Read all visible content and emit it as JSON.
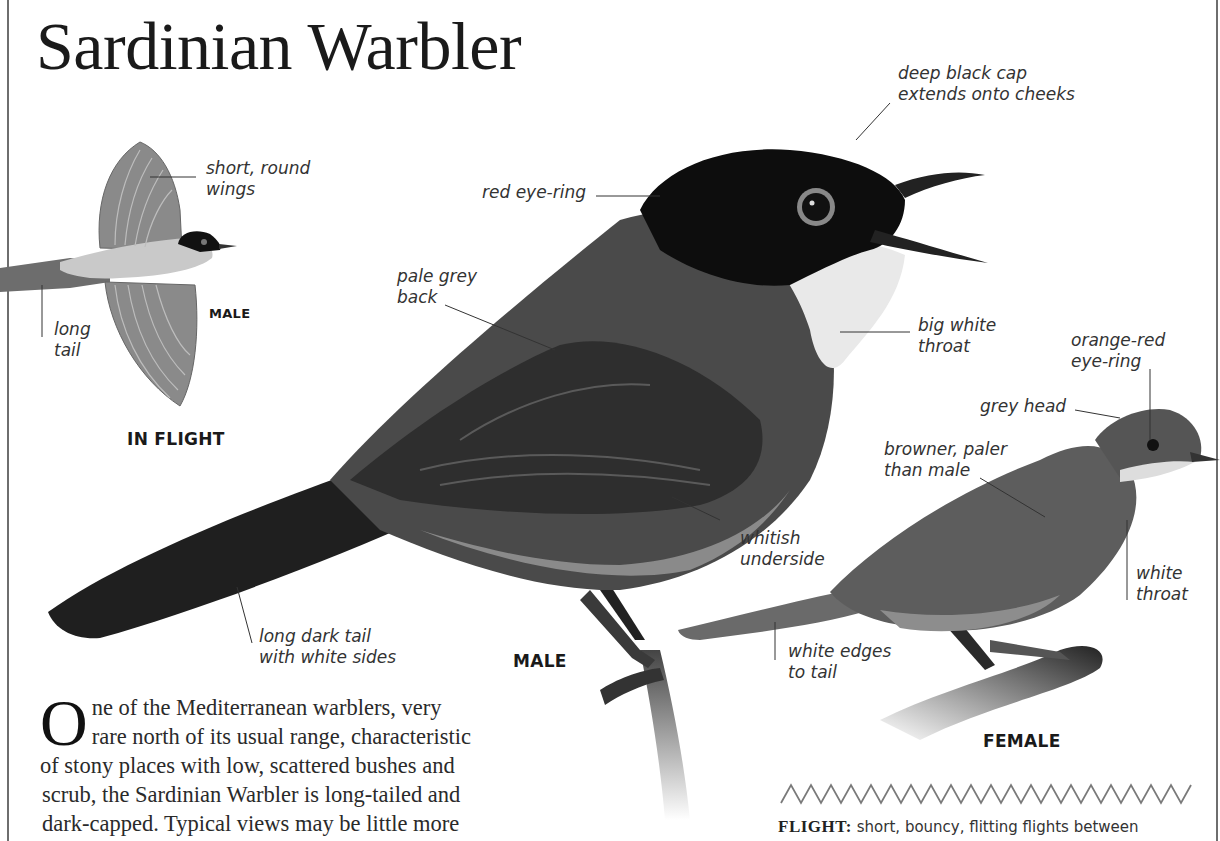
{
  "page": {
    "title": "Sardinian Warbler"
  },
  "flight_illustration": {
    "caption": "IN FLIGHT",
    "sex_label": "MALE",
    "annotations": [
      {
        "text": "short, round\nwings"
      },
      {
        "text": "long\ntail"
      }
    ]
  },
  "male": {
    "caption": "MALE",
    "annotations": [
      {
        "text": "deep black cap\nextends onto cheeks"
      },
      {
        "text": "red eye-ring"
      },
      {
        "text": "pale grey\nback"
      },
      {
        "text": "big white\nthroat"
      },
      {
        "text": "whitish\nunderside"
      },
      {
        "text": "long dark tail\nwith white sides"
      }
    ]
  },
  "female": {
    "caption": "FEMALE",
    "annotations": [
      {
        "text": "orange-red\neye-ring"
      },
      {
        "text": "grey head"
      },
      {
        "text": "browner, paler\nthan male"
      },
      {
        "text": "white\nthroat"
      },
      {
        "text": "white edges\nto tail"
      }
    ]
  },
  "description": {
    "drop_cap": "O",
    "lines": [
      "ne of the Mediterranean warblers, very",
      "rare north of its usual range, characteristic",
      "of stony places with low, scattered bushes and",
      "scrub, the Sardinian Warbler is long-tailed and",
      "dark-capped. Typical views may be little more"
    ]
  },
  "flight_pattern": {
    "icon": "zigzag-flight-pattern-icon",
    "peaks": 20,
    "label": "FLIGHT:",
    "text": " short, bouncy, flitting flights between"
  },
  "colors": {
    "rule": "#6e6e6e",
    "ink": "#1a1a1a",
    "zigzag": "#7a7a7a"
  }
}
